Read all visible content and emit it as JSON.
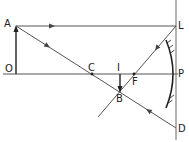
{
  "diagram": {
    "type": "optics-ray-diagram",
    "colors": {
      "line": "#555555",
      "mirror": "#333333",
      "text": "#222222",
      "background": "#ffffff"
    },
    "points": {
      "O": {
        "label": "O",
        "x": 16,
        "y": 74
      },
      "A": {
        "label": "A",
        "x": 16,
        "y": 26
      },
      "C": {
        "label": "C",
        "x": 92,
        "y": 74
      },
      "I": {
        "label": "I",
        "x": 120,
        "y": 74
      },
      "B": {
        "label": "B",
        "x": 120,
        "y": 92
      },
      "F": {
        "label": "F",
        "x": 134,
        "y": 74
      },
      "P": {
        "label": "P",
        "x": 176,
        "y": 74
      },
      "L": {
        "label": "L",
        "x": 176,
        "y": 26
      },
      "D": {
        "label": "D",
        "x": 176,
        "y": 128
      }
    },
    "labels": {
      "A": "A",
      "O": "O",
      "C": "C",
      "I": "I",
      "F": "F",
      "B": "B",
      "P": "P",
      "L": "L",
      "D": "D"
    },
    "rays": [
      {
        "name": "incident-parallel-ray",
        "from": "A",
        "to": "L",
        "arrow": "right"
      },
      {
        "name": "reflected-ray-through-focus",
        "from": "L",
        "to": "F",
        "continues_to": "beyond-B",
        "arrow": "down-left"
      },
      {
        "name": "incident-ray-through-centre",
        "from": "A",
        "to": "D",
        "via": "C",
        "arrow": "down-right"
      },
      {
        "name": "reflected-ray-back-through-centre",
        "from": "D",
        "to": "B",
        "arrow": "up-left"
      }
    ],
    "object": {
      "name": "object-OA",
      "from": "O",
      "to": "A",
      "direction": "up"
    },
    "image": {
      "name": "image-IB",
      "from": "I",
      "to": "B",
      "direction": "down"
    },
    "mirror": {
      "type": "concave",
      "pole": "P"
    }
  }
}
